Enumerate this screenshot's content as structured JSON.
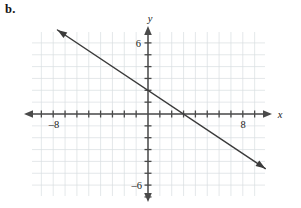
{
  "figure": {
    "part_label": "b."
  },
  "chart_data": {
    "type": "line",
    "title": "",
    "xlabel": "x",
    "ylabel": "y",
    "xlim": [
      -10,
      10
    ],
    "ylim": [
      -7,
      7
    ],
    "grid": true,
    "grid_step": 1,
    "legend": "none",
    "axis_arrows": "both-ends-both-axes",
    "x_tick_labels": [
      {
        "value": -8,
        "text": "–8"
      },
      {
        "value": 8,
        "text": "8"
      }
    ],
    "y_tick_labels": [
      {
        "value": 6,
        "text": "6"
      },
      {
        "value": -6,
        "text": "–6"
      }
    ],
    "tick_interval": 1,
    "series": [
      {
        "name": "line",
        "slope": -0.6667,
        "intercept": 2,
        "x_intercept": 3,
        "y_intercept": 2,
        "points": [
          {
            "x": -9.8,
            "y": 8.53
          },
          {
            "x": 9.9,
            "y": -4.6
          }
        ],
        "color": "#3b3b3b",
        "arrows": "both"
      }
    ],
    "colors": {
      "grid": "#d9dee1",
      "axis": "#4a4a4a",
      "line": "#3b3b3b",
      "background": "#ffffff",
      "text": "#1a1a1a"
    }
  }
}
